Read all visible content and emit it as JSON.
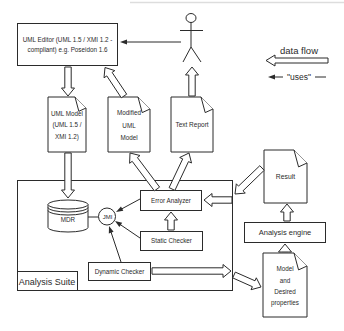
{
  "legend": {
    "data_flow_label": "data flow",
    "uses_label": "\"uses\""
  },
  "nodes": {
    "uml_editor": "UML Editor\n(UML 1.5 / XMI 1.2 - compliant)\ne.g. Poseidon 1.6",
    "uml_model": "UML Model\n(UML 1.5 /\nXMI 1.2)",
    "modified_uml_model": "Modified\nUML\nModel",
    "text_report": "Text Report",
    "result": "Result",
    "analysis_engine": "Analysis engine",
    "model_desired_properties": "Model\nand\nDesired\nproperties",
    "mdr": "MDR",
    "jmi": "JMI",
    "error_analyzer": "Error Analyzer",
    "static_checker": "Static Checker",
    "dynamic_checker": "Dynamic Checker",
    "analysis_suite": "Analysis Suite"
  },
  "colors": {
    "stroke": "#2b2b2b",
    "faint_line": "#dddddd",
    "background": "#ffffff"
  }
}
